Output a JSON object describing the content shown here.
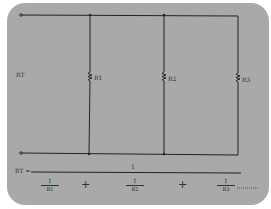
{
  "diagram": {
    "background_color": "#a9a9a9",
    "wire_color": "#222222",
    "total_label": "RT",
    "resistors": [
      {
        "label": "R1"
      },
      {
        "label": "R2"
      },
      {
        "label": "R3"
      }
    ],
    "formula": {
      "lhs": "RT =",
      "numerator": "1",
      "terms": [
        {
          "num": "1",
          "den": "R1"
        },
        {
          "num": "1",
          "den": "R2"
        },
        {
          "num": "1",
          "den": "R3"
        }
      ],
      "operator": "+",
      "continuation": "......"
    }
  }
}
